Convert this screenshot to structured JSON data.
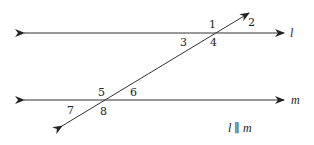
{
  "diagram": {
    "lines": {
      "l": {
        "label": "l",
        "y": 33
      },
      "m": {
        "label": "m",
        "y": 100
      }
    },
    "angles": [
      {
        "label": "1"
      },
      {
        "label": "2"
      },
      {
        "label": "3"
      },
      {
        "label": "4"
      },
      {
        "label": "5"
      },
      {
        "label": "6"
      },
      {
        "label": "7"
      },
      {
        "label": "8"
      }
    ],
    "caption": "l ∥ m",
    "stroke_color": "#333333"
  }
}
